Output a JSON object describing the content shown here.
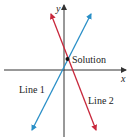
{
  "diagram": {
    "type": "coordinate-plane-linear-system",
    "axes": {
      "x_label": "x",
      "y_label": "y",
      "color": "#333333"
    },
    "lines": [
      {
        "name": "Line 1",
        "label": "Line 1",
        "color": "#2a8fc7",
        "slope_sign": "positive"
      },
      {
        "name": "Line 2",
        "label": "Line 2",
        "color": "#c8283c",
        "slope_sign": "negative"
      }
    ],
    "intersection": {
      "label": "Solution",
      "color": "#111111",
      "quadrant": "I"
    }
  }
}
